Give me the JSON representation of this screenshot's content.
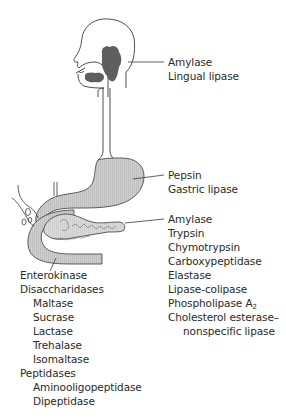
{
  "figure": {
    "type": "digestive-enzymes-diagram",
    "organs": [
      "mouth-salivary-glands",
      "esophagus",
      "stomach",
      "pancreas",
      "small-intestine"
    ]
  },
  "labels": {
    "salivary": {
      "items": [
        "Amylase",
        "Lingual lipase"
      ]
    },
    "stomach": {
      "items": [
        "Pepsin",
        "Gastric lipase"
      ]
    },
    "pancreas": {
      "items": [
        "Amylase",
        "Trypsin",
        "Chymotrypsin",
        "Carboxypeptidase",
        "Elastase",
        "Lipase-colipase"
      ],
      "phospholipase": {
        "base": "Phospholipase A",
        "sub": "2"
      },
      "cholesterol_line1": "Cholesterol esterase–",
      "cholesterol_line2": "nonspecific lipase"
    },
    "intestine": {
      "enterokinase": "Enterokinase",
      "disaccharidases": "Disaccharidases",
      "disaccharidase_items": [
        "Maltase",
        "Sucrase",
        "Lactase",
        "Trehalase",
        "Isomaltase"
      ],
      "peptidases": "Peptidases",
      "peptidase_items": [
        "Aminooligopeptidase",
        "Dipeptidase"
      ]
    }
  },
  "colors": {
    "outline": "#3a3a3a",
    "gland_fill": "#5e5e5e",
    "organ_fill": "#c8c8c8",
    "organ_hatch": "#9a9a9a",
    "text": "#2a2a2a"
  }
}
